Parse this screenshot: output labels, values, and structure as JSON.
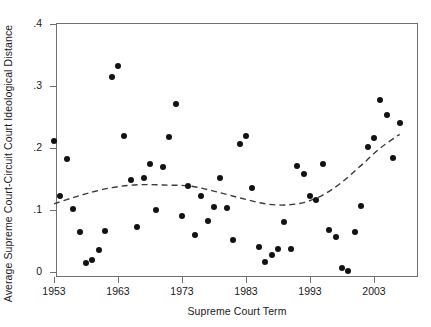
{
  "chart_data": {
    "type": "scatter",
    "title": "",
    "xlabel": "Supreme Court Term",
    "ylabel": "Average Supreme Court-Circuit Court Ideological Distance",
    "xlim": [
      1952,
      2009
    ],
    "ylim": [
      0,
      0.41
    ],
    "xticks": [
      1953,
      1963,
      1973,
      1983,
      1993,
      2003
    ],
    "xtick_labels": [
      "1953",
      "1963",
      "1973",
      "1983",
      "1993",
      "2003"
    ],
    "yticks": [
      0,
      0.1,
      0.2,
      0.3,
      0.4
    ],
    "ytick_labels": [
      "0",
      ".1",
      ".2",
      ".3",
      ".4"
    ],
    "grid": false,
    "legend": null,
    "marker_color": "#121212",
    "trend_color": "#3a3a3a",
    "trend_style": "dashed",
    "points": [
      {
        "x": 1953,
        "y": 0.212
      },
      {
        "x": 1954,
        "y": 0.122
      },
      {
        "x": 1955,
        "y": 0.182
      },
      {
        "x": 1956,
        "y": 0.101
      },
      {
        "x": 1957,
        "y": 0.064
      },
      {
        "x": 1958,
        "y": 0.014
      },
      {
        "x": 1959,
        "y": 0.019
      },
      {
        "x": 1960,
        "y": 0.035
      },
      {
        "x": 1961,
        "y": 0.066
      },
      {
        "x": 1962,
        "y": 0.314
      },
      {
        "x": 1963,
        "y": 0.332
      },
      {
        "x": 1964,
        "y": 0.22
      },
      {
        "x": 1965,
        "y": 0.148
      },
      {
        "x": 1966,
        "y": 0.073
      },
      {
        "x": 1967,
        "y": 0.152
      },
      {
        "x": 1968,
        "y": 0.174
      },
      {
        "x": 1969,
        "y": 0.1
      },
      {
        "x": 1970,
        "y": 0.17
      },
      {
        "x": 1971,
        "y": 0.218
      },
      {
        "x": 1972,
        "y": 0.271
      },
      {
        "x": 1973,
        "y": 0.09
      },
      {
        "x": 1974,
        "y": 0.139
      },
      {
        "x": 1975,
        "y": 0.06
      },
      {
        "x": 1976,
        "y": 0.123
      },
      {
        "x": 1977,
        "y": 0.082
      },
      {
        "x": 1978,
        "y": 0.105
      },
      {
        "x": 1979,
        "y": 0.152
      },
      {
        "x": 1980,
        "y": 0.104
      },
      {
        "x": 1981,
        "y": 0.052
      },
      {
        "x": 1982,
        "y": 0.206
      },
      {
        "x": 1983,
        "y": 0.22
      },
      {
        "x": 1984,
        "y": 0.135
      },
      {
        "x": 1985,
        "y": 0.041
      },
      {
        "x": 1986,
        "y": 0.016
      },
      {
        "x": 1987,
        "y": 0.028
      },
      {
        "x": 1988,
        "y": 0.037
      },
      {
        "x": 1989,
        "y": 0.081
      },
      {
        "x": 1990,
        "y": 0.037
      },
      {
        "x": 1991,
        "y": 0.171
      },
      {
        "x": 1992,
        "y": 0.158
      },
      {
        "x": 1993,
        "y": 0.122
      },
      {
        "x": 1994,
        "y": 0.116
      },
      {
        "x": 1995,
        "y": 0.174
      },
      {
        "x": 1996,
        "y": 0.067
      },
      {
        "x": 1997,
        "y": 0.057
      },
      {
        "x": 1998,
        "y": 0.006
      },
      {
        "x": 1999,
        "y": 0.002
      },
      {
        "x": 2000,
        "y": 0.065
      },
      {
        "x": 2001,
        "y": 0.106
      },
      {
        "x": 2002,
        "y": 0.202
      },
      {
        "x": 2003,
        "y": 0.216
      },
      {
        "x": 2004,
        "y": 0.278
      },
      {
        "x": 2005,
        "y": 0.254
      },
      {
        "x": 2006,
        "y": 0.184
      },
      {
        "x": 2007,
        "y": 0.24
      }
    ],
    "trend_line": {
      "name": "lowess-fit",
      "x": [
        1953,
        1956,
        1959,
        1962,
        1965,
        1968,
        1971,
        1974,
        1977,
        1980,
        1983,
        1986,
        1989,
        1992,
        1995,
        1998,
        2001,
        2004,
        2007
      ],
      "y": [
        0.11,
        0.12,
        0.129,
        0.136,
        0.14,
        0.141,
        0.14,
        0.139,
        0.133,
        0.125,
        0.117,
        0.11,
        0.108,
        0.112,
        0.124,
        0.145,
        0.172,
        0.2,
        0.222
      ]
    }
  }
}
